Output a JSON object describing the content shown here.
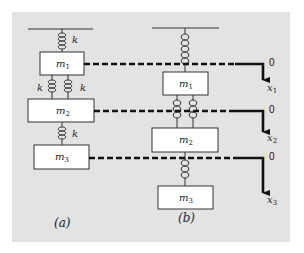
{
  "figure": {
    "background": "#ffffff",
    "panel_color": "#e3e3e3",
    "box_fill": "#ffffff",
    "stroke_color": "#222222",
    "line_color": "#111111"
  },
  "panel_a": {
    "caption": "(a)",
    "spring_labels": [
      "k",
      "k",
      "k",
      "k"
    ],
    "masses": [
      {
        "label": "m",
        "sub": "1"
      },
      {
        "label": "m",
        "sub": "2"
      },
      {
        "label": "m",
        "sub": "3"
      }
    ]
  },
  "panel_b": {
    "caption": "(b)",
    "masses": [
      {
        "label": "m",
        "sub": "1"
      },
      {
        "label": "m",
        "sub": "2"
      },
      {
        "label": "m",
        "sub": "3"
      }
    ]
  },
  "axes": [
    {
      "origin_label": "0",
      "axis_label": "x",
      "sub": "1"
    },
    {
      "origin_label": "0",
      "axis_label": "x",
      "sub": "2"
    },
    {
      "origin_label": "0",
      "axis_label": "x",
      "sub": "3"
    }
  ]
}
